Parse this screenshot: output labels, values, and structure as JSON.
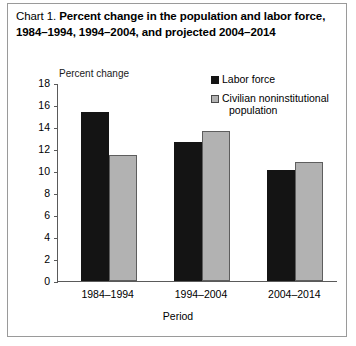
{
  "title": {
    "prefix": "Chart 1. ",
    "main": "Percent change in the population and labor force, 1984–1994, 1994–2004, and projected 2004–2014"
  },
  "legend": {
    "items": [
      {
        "label": "Labor force",
        "color": "#141414",
        "swatch": "black-square"
      },
      {
        "label": "Civilian noninstitutional",
        "label2": "population",
        "color": "#b2b2b2",
        "swatch": "gray-square"
      }
    ]
  },
  "axes": {
    "ylabel": "Percent change",
    "xlabel": "Period",
    "yticks": [
      "18",
      "16",
      "14",
      "12",
      "10",
      "8",
      "6",
      "4",
      "2",
      "0"
    ]
  },
  "chart_data": {
    "type": "bar",
    "title": "Chart 1. Percent change in the population and labor force, 1984–1994, 1994–2004, and projected 2004–2014",
    "categories": [
      "1984–1994",
      "1994–2004",
      "2004–2014"
    ],
    "series": [
      {
        "name": "Labor force",
        "values": [
          15.4,
          12.6,
          10.1
        ],
        "color": "#141414"
      },
      {
        "name": "Civilian noninstitutional population",
        "values": [
          11.5,
          13.6,
          10.8
        ],
        "color": "#b2b2b2"
      }
    ],
    "xlabel": "Period",
    "ylabel": "Percent change",
    "ylim": [
      0,
      18
    ],
    "ytick_step": 2,
    "grid": false,
    "legend_position": "top-right"
  }
}
